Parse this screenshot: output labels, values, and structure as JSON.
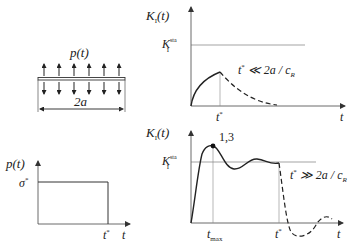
{
  "panels": {
    "plate": {
      "load_label": "p(t)",
      "width_label": "2a",
      "arrows_up": 6,
      "arrows_down": 6
    },
    "pulse": {
      "y_label": "p(t)",
      "level_label": "σ",
      "level_sup": "*",
      "x_tick_label": "t",
      "x_tick_sup": "*",
      "x_axis_label": "t"
    },
    "short_load": {
      "y_label_main": "K",
      "y_label_sub": "I",
      "y_label_arg": "(t)",
      "static_label_main": "K",
      "static_label_sub": "I",
      "static_label_sup": "sta",
      "condition_t": "t",
      "condition_sup": "*",
      "condition_rest": " ≪ 2a / c",
      "condition_sub": "R",
      "x_tick_label": "t",
      "x_tick_sup": "*",
      "x_axis_label": "t"
    },
    "long_load": {
      "y_label_main": "K",
      "y_label_sub": "I",
      "y_label_arg": "(t)",
      "static_label_main": "K",
      "static_label_sub": "I",
      "static_label_sup": "sta",
      "peak_label": "1,3",
      "condition_t": "t",
      "condition_sup": "*",
      "condition_rest": " ≫ 2a / c",
      "condition_sub": "R",
      "tmax_label": "t",
      "tmax_sub": "max",
      "x_tick_label": "t",
      "x_tick_sup": "*",
      "x_axis_label": "t"
    }
  }
}
